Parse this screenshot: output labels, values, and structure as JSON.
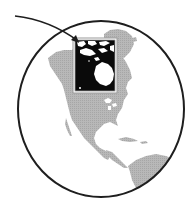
{
  "map": {
    "type": "orthographic globe illustration",
    "view": "Western Hemisphere",
    "regions_shown": [
      "North America",
      "Greenland",
      "Central America",
      "Caribbean",
      "South America (northern)"
    ],
    "highlight": {
      "region": "Northern Canada / Hudson Bay",
      "style": "inset box, black fill with white land"
    },
    "pointer": "curved arrow pointing to highlighted region",
    "colors": {
      "background": "#ffffff",
      "ocean": "#ffffff",
      "land": "#b4b4b4",
      "globe_outline": "#1e1e1e",
      "highlight_fill": "#0a0a0a",
      "highlight_land": "#ffffff",
      "highlight_border": "#9a9a9a",
      "arrow": "#1e1e1e"
    }
  }
}
